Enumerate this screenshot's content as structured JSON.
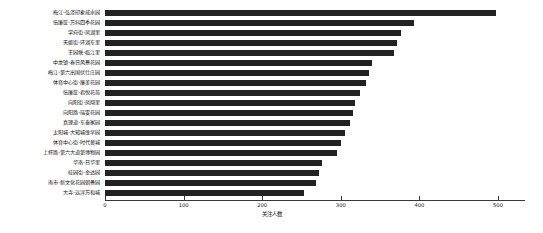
{
  "chart_data": {
    "type": "bar",
    "orientation": "horizontal",
    "title": "",
    "xlabel": "关注人数",
    "ylabel": "",
    "xlim": [
      0,
      534
    ],
    "xticks": [
      0,
      100,
      200,
      300,
      400,
      500
    ],
    "xticklabels": [
      "0",
      "100",
      "200",
      "300",
      "400",
      "500"
    ],
    "grid": false,
    "legend": null,
    "bar_color": "#222222",
    "categories": [
      "梅江-弘泽印象威水园",
      "伍廉筐-万科四季花园",
      "学府街-凤湖里",
      "天姬街-环湖东里",
      "王园塘-临江里",
      "中龙镇-春日风景花园",
      "梅江-第六出国伏仕庄园",
      "体育中心街-廉美花园",
      "伍廉筐-君悦花苑",
      "向阳街-凤翔里",
      "向阳路-瑞雯花园",
      "真理道-东泰家园",
      "太阳城-大知城维早园",
      "体育中心街-时代奥城",
      "上杯路-第六大道第博物园",
      "华南-日华里",
      "桂园街-金达园",
      "南市-新文化花园朝景园",
      "大寺-远洋万和城"
    ],
    "values": [
      497,
      393,
      377,
      372,
      368,
      340,
      336,
      332,
      324,
      318,
      316,
      312,
      305,
      300,
      295,
      276,
      272,
      268,
      253
    ]
  }
}
